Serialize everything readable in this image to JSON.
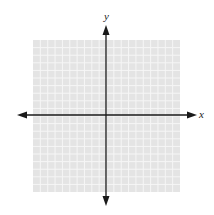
{
  "figure": {
    "type": "coordinate-plane",
    "axes": {
      "x_label": "x",
      "y_label": "y"
    },
    "grid": {
      "columns": 20,
      "rows": 20,
      "fill_color": "#e4e4e4",
      "line_color": "#f6f6f6"
    },
    "axis_color": "#1a1a1a"
  }
}
